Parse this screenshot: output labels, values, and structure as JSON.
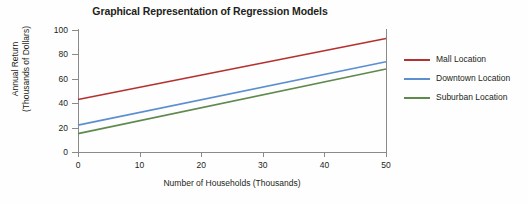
{
  "chart_data": {
    "type": "line",
    "title": "Graphical Representation of Regression Models",
    "xlabel": "Number of Households (Thousands)",
    "ylabel_line1": "Annual Return",
    "ylabel_line2": "(Thousands of Dollars)",
    "x": [
      0,
      50
    ],
    "xlim": [
      0,
      50
    ],
    "ylim": [
      0,
      100
    ],
    "xticks": [
      0,
      10,
      20,
      30,
      40,
      50
    ],
    "yticks": [
      0,
      20,
      40,
      60,
      80,
      100
    ],
    "xtick_labels": [
      "0",
      "10",
      "20",
      "30",
      "40",
      "50"
    ],
    "ytick_labels": [
      "0",
      "20",
      "40",
      "60",
      "80",
      "100"
    ],
    "grid": false,
    "legend_position": "right",
    "series": [
      {
        "name": "Mall Location",
        "color": "#b5312f",
        "values": [
          43,
          93
        ],
        "intercept": 43,
        "slope": 1.0
      },
      {
        "name": "Downtown Location",
        "color": "#5b8fd0",
        "values": [
          22,
          74
        ],
        "intercept": 22,
        "slope": 1.04
      },
      {
        "name": "Suburban Location",
        "color": "#5f8a4e",
        "values": [
          15,
          68
        ],
        "intercept": 15,
        "slope": 1.06
      }
    ]
  },
  "colors": {
    "axis": "#8a8a8a",
    "text": "#231f20",
    "background": "#fefefe"
  }
}
